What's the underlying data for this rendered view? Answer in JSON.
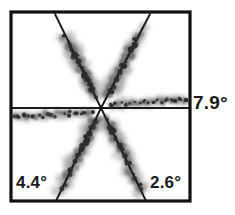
{
  "figure": {
    "background_color": "#ffffff",
    "frame_color": "#111111",
    "axis_line_color": "#111111",
    "arm_line_color": "#1a1a1a",
    "scatter_dark_color": "#2b2b2b",
    "scatter_mid_color": "#6e6e6e",
    "scatter_light_color": "#a8a8a8",
    "frame": {
      "x": 11,
      "y": 12,
      "width": 179,
      "height": 189
    },
    "center": {
      "x": 101,
      "y": 108
    }
  },
  "labels": {
    "right": "7.9°",
    "bottom_left": "4.4°",
    "bottom_right": "2.6°"
  },
  "chart_data": {
    "type": "scatter",
    "xlabel": "",
    "ylabel": "",
    "xlim": [
      -1,
      1
    ],
    "ylim": [
      -1,
      1
    ],
    "grid": false,
    "legend": "none",
    "annotations": [
      {
        "text": "7.9°",
        "position": "right-outside",
        "x": 196,
        "y": 103,
        "refers_to": "horizontal-arm-pair"
      },
      {
        "text": "4.4°",
        "position": "bottom-left-inside",
        "x": 34,
        "y": 183,
        "refers_to": "lower-left-arm"
      },
      {
        "text": "2.6°",
        "position": "bottom-right-inside",
        "x": 166,
        "y": 183,
        "refers_to": "lower-right-arm"
      }
    ],
    "series": [
      {
        "name": "upper-left-arm",
        "angle_deg": 115,
        "line": {
          "x1": 101,
          "y1": 108,
          "x2": 55,
          "y2": 14
        },
        "spread": "wide",
        "points": [
          [
            93,
            92
          ],
          [
            90,
            86
          ],
          [
            87,
            80
          ],
          [
            84,
            74
          ],
          [
            81,
            68
          ],
          [
            78,
            62
          ],
          [
            75,
            56
          ],
          [
            72,
            50
          ],
          [
            69,
            45
          ],
          [
            66,
            40
          ],
          [
            86,
            78
          ],
          [
            83,
            71
          ],
          [
            80,
            65
          ],
          [
            77,
            59
          ],
          [
            74,
            53
          ],
          [
            71,
            47
          ],
          [
            95,
            96
          ],
          [
            91,
            88
          ],
          [
            88,
            82
          ],
          [
            85,
            75
          ],
          [
            82,
            69
          ],
          [
            79,
            63
          ],
          [
            76,
            57
          ],
          [
            73,
            51
          ],
          [
            70,
            46
          ],
          [
            67,
            41
          ],
          [
            64,
            37
          ],
          [
            92,
            90
          ],
          [
            89,
            84
          ],
          [
            86,
            77
          ]
        ]
      },
      {
        "name": "upper-right-arm",
        "angle_deg": 65,
        "line": {
          "x1": 101,
          "y1": 108,
          "x2": 150,
          "y2": 14
        },
        "spread": "wide",
        "points": [
          [
            109,
            93
          ],
          [
            112,
            87
          ],
          [
            115,
            81
          ],
          [
            118,
            75
          ],
          [
            121,
            69
          ],
          [
            124,
            63
          ],
          [
            127,
            57
          ],
          [
            130,
            51
          ],
          [
            133,
            45
          ],
          [
            136,
            39
          ],
          [
            111,
            90
          ],
          [
            114,
            84
          ],
          [
            117,
            78
          ],
          [
            120,
            72
          ],
          [
            123,
            66
          ],
          [
            126,
            60
          ],
          [
            129,
            54
          ],
          [
            132,
            48
          ],
          [
            107,
            97
          ],
          [
            110,
            91
          ],
          [
            113,
            85
          ],
          [
            116,
            79
          ],
          [
            119,
            73
          ],
          [
            122,
            67
          ],
          [
            125,
            61
          ],
          [
            128,
            55
          ],
          [
            131,
            49
          ],
          [
            134,
            43
          ],
          [
            137,
            37
          ],
          [
            140,
            31
          ]
        ]
      },
      {
        "name": "right-horizontal-arm",
        "angle_deg": 0,
        "line": {
          "x1": 101,
          "y1": 108,
          "x2": 190,
          "y2": 108
        },
        "spread": "narrow",
        "points": [
          [
            110,
            105
          ],
          [
            116,
            104
          ],
          [
            122,
            103
          ],
          [
            128,
            104
          ],
          [
            134,
            102
          ],
          [
            140,
            103
          ],
          [
            146,
            101
          ],
          [
            152,
            102
          ],
          [
            158,
            100
          ],
          [
            164,
            101
          ],
          [
            170,
            100
          ],
          [
            176,
            101
          ],
          [
            182,
            100
          ],
          [
            188,
            101
          ],
          [
            113,
            106
          ],
          [
            119,
            105
          ],
          [
            125,
            105
          ],
          [
            131,
            103
          ],
          [
            137,
            104
          ],
          [
            143,
            102
          ],
          [
            149,
            103
          ],
          [
            155,
            101
          ],
          [
            161,
            102
          ],
          [
            167,
            100
          ],
          [
            173,
            101
          ],
          [
            179,
            99
          ],
          [
            185,
            100
          ]
        ]
      },
      {
        "name": "left-horizontal-arm",
        "angle_deg": 180,
        "line": {
          "x1": 101,
          "y1": 108,
          "x2": 11,
          "y2": 108
        },
        "spread": "narrow",
        "points": [
          [
            92,
            112
          ],
          [
            86,
            113
          ],
          [
            80,
            114
          ],
          [
            74,
            113
          ],
          [
            68,
            115
          ],
          [
            62,
            114
          ],
          [
            56,
            116
          ],
          [
            50,
            115
          ],
          [
            44,
            117
          ],
          [
            38,
            116
          ],
          [
            32,
            117
          ],
          [
            26,
            116
          ],
          [
            20,
            117
          ],
          [
            14,
            116
          ],
          [
            89,
            111
          ],
          [
            83,
            112
          ],
          [
            77,
            113
          ],
          [
            71,
            112
          ],
          [
            65,
            114
          ],
          [
            59,
            113
          ],
          [
            53,
            115
          ],
          [
            47,
            114
          ],
          [
            41,
            116
          ],
          [
            35,
            115
          ],
          [
            29,
            116
          ],
          [
            23,
            115
          ],
          [
            17,
            116
          ]
        ]
      },
      {
        "name": "lower-left-arm",
        "angle_deg": 245,
        "line": {
          "x1": 101,
          "y1": 108,
          "x2": 56,
          "y2": 201
        },
        "spread": "wide",
        "points": [
          [
            94,
            123
          ],
          [
            91,
            129
          ],
          [
            88,
            135
          ],
          [
            85,
            141
          ],
          [
            82,
            147
          ],
          [
            79,
            153
          ],
          [
            76,
            159
          ],
          [
            73,
            165
          ],
          [
            70,
            171
          ],
          [
            67,
            177
          ],
          [
            64,
            183
          ],
          [
            61,
            189
          ],
          [
            96,
            120
          ],
          [
            93,
            126
          ],
          [
            90,
            132
          ],
          [
            87,
            138
          ],
          [
            84,
            144
          ],
          [
            81,
            150
          ],
          [
            78,
            156
          ],
          [
            75,
            162
          ],
          [
            72,
            168
          ],
          [
            69,
            174
          ],
          [
            66,
            180
          ],
          [
            63,
            186
          ],
          [
            92,
            127
          ],
          [
            89,
            133
          ],
          [
            86,
            139
          ],
          [
            83,
            145
          ],
          [
            80,
            151
          ],
          [
            77,
            157
          ]
        ]
      },
      {
        "name": "lower-right-arm",
        "angle_deg": 295,
        "line": {
          "x1": 101,
          "y1": 108,
          "x2": 146,
          "y2": 201
        },
        "spread": "wide",
        "points": [
          [
            108,
            123
          ],
          [
            111,
            129
          ],
          [
            114,
            135
          ],
          [
            117,
            141
          ],
          [
            120,
            147
          ],
          [
            123,
            153
          ],
          [
            126,
            159
          ],
          [
            129,
            165
          ],
          [
            132,
            171
          ],
          [
            135,
            177
          ],
          [
            138,
            183
          ],
          [
            141,
            189
          ],
          [
            106,
            120
          ],
          [
            109,
            126
          ],
          [
            112,
            132
          ],
          [
            115,
            138
          ],
          [
            118,
            144
          ],
          [
            121,
            150
          ],
          [
            124,
            156
          ],
          [
            127,
            162
          ],
          [
            130,
            168
          ],
          [
            133,
            174
          ],
          [
            136,
            180
          ],
          [
            139,
            186
          ],
          [
            110,
            127
          ],
          [
            113,
            133
          ],
          [
            116,
            139
          ],
          [
            119,
            145
          ],
          [
            122,
            151
          ],
          [
            125,
            157
          ]
        ]
      }
    ]
  }
}
